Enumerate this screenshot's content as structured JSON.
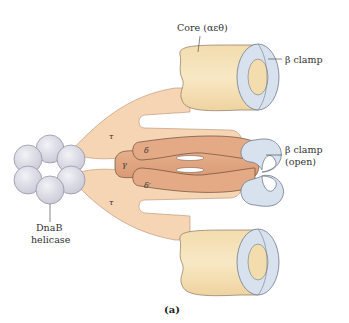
{
  "diagram": {
    "caption": "(a)",
    "labels": {
      "core": "Core (αεθ)",
      "beta_clamp_top": "β clamp",
      "beta_clamp_open_line1": "β clamp",
      "beta_clamp_open_line2": "(open)",
      "dnab_line1": "DnaB",
      "dnab_line2": "helicase"
    },
    "subunits": {
      "tau_top": "τ",
      "tau_bottom": "τ",
      "gamma": "γ",
      "delta": "δ",
      "delta_prime": "δ′"
    },
    "colors": {
      "core_fill": "#f6dfb0",
      "tau_fill": "#f5d5b3",
      "clamp_loader_fill": "#e3a884",
      "beta_clamp_fill": "#d8e2ee",
      "helicase_fill": "#dcdbe6",
      "outline": "#6b5a4a"
    }
  }
}
